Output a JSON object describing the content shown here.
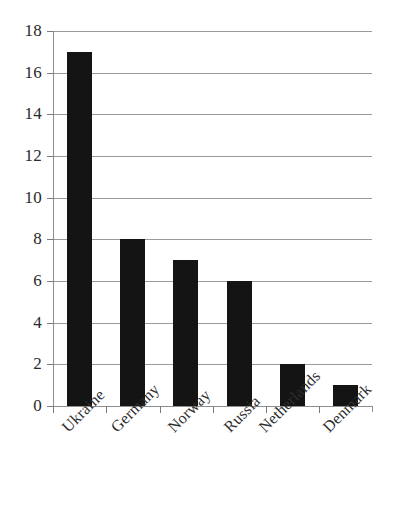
{
  "chart_data": {
    "type": "bar",
    "title": "",
    "subtitle": "",
    "xlabel": "",
    "ylabel": "",
    "categories": [
      "Ukraine",
      "Germany",
      "Norway",
      "Russia",
      "Netherlands",
      "Denmark"
    ],
    "values": [
      17,
      8,
      7,
      6,
      2,
      1
    ],
    "series": [
      {
        "name": "",
        "values": [
          17,
          8,
          7,
          6,
          2,
          1
        ]
      }
    ],
    "ylim": [
      0,
      18
    ],
    "xlim": [
      0,
      6
    ],
    "y_ticks": [
      0,
      2,
      4,
      6,
      8,
      10,
      12,
      14,
      16,
      18
    ],
    "y_tick_labels": [
      "0",
      "2",
      "4",
      "6",
      "8",
      "10",
      "12",
      "14",
      "16",
      "18"
    ],
    "grid": true,
    "grid_axis": "y",
    "legend": false,
    "legend_position": "none",
    "bar_color": "#141414",
    "grid_color": "#9a9a9a",
    "axis_color": "#8e8e8e",
    "background_color": "#ffffff",
    "text_color": "#2a2a2a",
    "x_tick_label_rotation": -45,
    "annotations": []
  },
  "axis": {
    "y_labels": [
      "18",
      "16",
      "14",
      "12",
      "10",
      "8",
      "6",
      "4",
      "2",
      "0"
    ]
  },
  "bars": [
    {
      "label": "Ukraine",
      "value": 17
    },
    {
      "label": "Germany",
      "value": 8
    },
    {
      "label": "Norway",
      "value": 7
    },
    {
      "label": "Russia",
      "value": 6
    },
    {
      "label": "Netherlands",
      "value": 2
    },
    {
      "label": "Denmark",
      "value": 1
    }
  ]
}
